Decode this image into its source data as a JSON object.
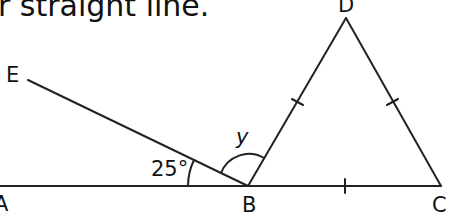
{
  "caption": "r straight line.",
  "points": {
    "A": "A",
    "B": "B",
    "C": "C",
    "D": "D",
    "E": "E"
  },
  "angles": {
    "ABE": "25°",
    "EBD": "y"
  },
  "colors": {
    "line": "#222222",
    "background": "#ffffff"
  }
}
